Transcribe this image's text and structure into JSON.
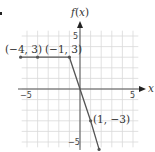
{
  "chart_data": {
    "type": "line",
    "title": "",
    "xlabel": "x",
    "ylabel": "f(x)",
    "xlim": [
      -5.5,
      5.5
    ],
    "ylim": [
      -5.5,
      5.5
    ],
    "grid": true,
    "x_ticks": [
      {
        "value": -5,
        "label": "−5"
      },
      {
        "value": 5,
        "label": "5"
      }
    ],
    "y_ticks": [
      {
        "value": 5,
        "label": "5"
      },
      {
        "value": -5,
        "label": "−5"
      }
    ],
    "series": [
      {
        "name": "f(x)",
        "color": "#555555",
        "points": [
          [
            -5.6,
            3
          ],
          [
            -4,
            3
          ],
          [
            -1,
            3
          ],
          [
            0,
            0
          ],
          [
            1,
            -3
          ],
          [
            1.8,
            -5.7
          ]
        ]
      }
    ],
    "annotations": [
      {
        "x": -4,
        "y": 3,
        "label": "(−4, 3)"
      },
      {
        "x": -1,
        "y": 3,
        "label": "(−1, 3)"
      },
      {
        "x": 1,
        "y": -3,
        "label": "(1, −3)"
      }
    ]
  },
  "labels": {
    "x_axis": "x",
    "y_axis_f": "f",
    "y_axis_open": "(",
    "y_axis_x": "x",
    "y_axis_close": ")",
    "tick_x_neg5": "−5",
    "tick_x_5": "5",
    "tick_y_5": "5",
    "tick_y_neg5": "−5",
    "pt1": "(−4, 3)",
    "pt2": "(−1, 3)",
    "pt3": "(1, −3)"
  }
}
